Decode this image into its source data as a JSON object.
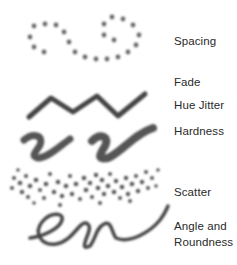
{
  "figure": {
    "labels": {
      "spacing": "Spacing",
      "fade": "Fade",
      "hue_jitter": "Hue Jitter",
      "hardness": "Hardness",
      "scatter": "Scatter",
      "angle_line1": "Angle and",
      "angle_line2": "Roundness"
    },
    "stroke_color": "#555555"
  }
}
